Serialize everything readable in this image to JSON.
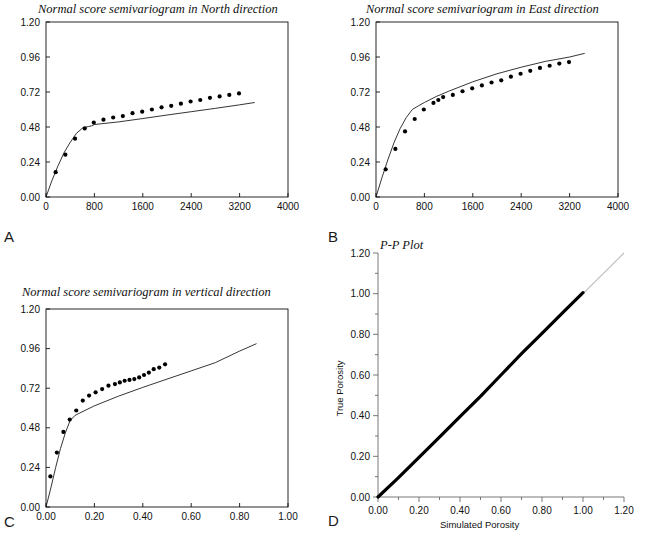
{
  "figure": {
    "width": 648,
    "height": 535,
    "background": "#ffffff",
    "line_color": "#111111",
    "marker_color": "#000000",
    "reference_line_color": "#bbbbbb"
  },
  "panels": [
    {
      "key": "A",
      "label": "A",
      "title": "Normal score semivariogram in North direction",
      "xlabel": "",
      "ylabel": "",
      "xticks": [
        "0",
        "800",
        "1600",
        "2400",
        "3200",
        "4000"
      ],
      "yticks": [
        "0.00",
        "0.24",
        "0.48",
        "0.72",
        "0.96",
        "1.20"
      ]
    },
    {
      "key": "B",
      "label": "B",
      "title": "Normal score semivariogram in East direction",
      "xlabel": "",
      "ylabel": "",
      "xticks": [
        "0",
        "800",
        "1600",
        "2400",
        "3200",
        "4000"
      ],
      "yticks": [
        "0.00",
        "0.24",
        "0.48",
        "0.72",
        "0.96",
        "1.20"
      ]
    },
    {
      "key": "C",
      "label": "C",
      "title": "Normal score semivariogram in vertical direction",
      "xlabel": "",
      "ylabel": "",
      "xticks": [
        "0.00",
        "0.20",
        "0.40",
        "0.60",
        "0.80",
        "1.00"
      ],
      "yticks": [
        "0.00",
        "0.24",
        "0.48",
        "0.72",
        "0.96",
        "1.20"
      ]
    },
    {
      "key": "D",
      "label": "D",
      "title": "P-P Plot",
      "xlabel": "Simulated Porosity",
      "ylabel": "True Porosity",
      "xticks": [
        "0.00",
        "0.20",
        "0.40",
        "0.60",
        "0.80",
        "1.00",
        "1.20"
      ],
      "yticks": [
        "0.00",
        "0.20",
        "0.40",
        "0.60",
        "0.80",
        "1.00",
        "1.20"
      ]
    }
  ],
  "chart_data": [
    {
      "type": "scatter",
      "panel": "A",
      "title": "Normal score semivariogram in North direction",
      "xlabel": "",
      "ylabel": "",
      "xlim": [
        0,
        4000
      ],
      "ylim": [
        0,
        1.2
      ],
      "grid": false,
      "legend": "none",
      "series": [
        {
          "name": "experimental semivariogram",
          "style": "points",
          "x": [
            160,
            320,
            480,
            640,
            790,
            950,
            1110,
            1270,
            1430,
            1590,
            1750,
            1910,
            2070,
            2230,
            2390,
            2550,
            2710,
            2870,
            3030,
            3190
          ],
          "y": [
            0.17,
            0.29,
            0.4,
            0.47,
            0.51,
            0.53,
            0.545,
            0.555,
            0.575,
            0.585,
            0.6,
            0.615,
            0.625,
            0.64,
            0.655,
            0.665,
            0.68,
            0.69,
            0.7,
            0.71
          ]
        },
        {
          "name": "model semivariogram",
          "style": "line",
          "x": [
            0,
            100,
            200,
            300,
            400,
            500,
            600,
            700,
            750,
            800,
            1200,
            1600,
            2000,
            2400,
            2800,
            3200,
            3450
          ],
          "y": [
            0.0,
            0.115,
            0.215,
            0.305,
            0.375,
            0.435,
            0.472,
            0.483,
            0.487,
            0.497,
            0.515,
            0.538,
            0.562,
            0.585,
            0.608,
            0.632,
            0.648
          ]
        }
      ]
    },
    {
      "type": "scatter",
      "panel": "B",
      "title": "Normal score semivariogram in East direction",
      "xlabel": "",
      "ylabel": "",
      "xlim": [
        0,
        4000
      ],
      "ylim": [
        0,
        1.2
      ],
      "grid": false,
      "legend": "none",
      "series": [
        {
          "name": "experimental semivariogram",
          "style": "points",
          "x": [
            160,
            320,
            480,
            640,
            790,
            950,
            1030,
            1110,
            1270,
            1430,
            1590,
            1750,
            1910,
            2070,
            2230,
            2390,
            2550,
            2710,
            2870,
            3030,
            3190
          ],
          "y": [
            0.19,
            0.33,
            0.45,
            0.535,
            0.6,
            0.645,
            0.665,
            0.685,
            0.7,
            0.725,
            0.745,
            0.765,
            0.785,
            0.8,
            0.825,
            0.845,
            0.865,
            0.885,
            0.9,
            0.915,
            0.925
          ]
        },
        {
          "name": "model semivariogram",
          "style": "line",
          "x": [
            0,
            100,
            200,
            300,
            400,
            500,
            600,
            700,
            800,
            1000,
            1200,
            1600,
            2000,
            2400,
            2800,
            3200,
            3450
          ],
          "y": [
            0.0,
            0.135,
            0.26,
            0.375,
            0.47,
            0.545,
            0.6,
            0.625,
            0.648,
            0.69,
            0.725,
            0.79,
            0.845,
            0.89,
            0.93,
            0.96,
            0.985
          ]
        }
      ]
    },
    {
      "type": "scatter",
      "panel": "C",
      "title": "Normal score semivariogram in vertical direction",
      "xlabel": "",
      "ylabel": "",
      "xlim": [
        0,
        1.0
      ],
      "ylim": [
        0,
        1.2
      ],
      "grid": false,
      "legend": "none",
      "series": [
        {
          "name": "experimental semivariogram",
          "style": "points",
          "x": [
            0.018,
            0.045,
            0.072,
            0.098,
            0.125,
            0.152,
            0.178,
            0.205,
            0.232,
            0.258,
            0.285,
            0.305,
            0.325,
            0.345,
            0.365,
            0.385,
            0.405,
            0.425,
            0.445,
            0.468,
            0.492
          ],
          "y": [
            0.185,
            0.33,
            0.455,
            0.53,
            0.585,
            0.645,
            0.675,
            0.695,
            0.715,
            0.735,
            0.745,
            0.755,
            0.765,
            0.77,
            0.775,
            0.785,
            0.8,
            0.815,
            0.835,
            0.845,
            0.865
          ]
        },
        {
          "name": "model semivariogram",
          "style": "line",
          "x": [
            0.0,
            0.02,
            0.04,
            0.06,
            0.08,
            0.1,
            0.12,
            0.14,
            0.2,
            0.3,
            0.4,
            0.5,
            0.6,
            0.7,
            0.8,
            0.87
          ],
          "y": [
            0.0,
            0.115,
            0.24,
            0.355,
            0.45,
            0.525,
            0.555,
            0.57,
            0.613,
            0.672,
            0.725,
            0.775,
            0.825,
            0.875,
            0.945,
            0.99
          ]
        }
      ]
    },
    {
      "type": "line",
      "panel": "D",
      "title": "P-P Plot",
      "xlabel": "Simulated Porosity",
      "ylabel": "True Porosity",
      "xlim": [
        0,
        1.2
      ],
      "ylim": [
        0,
        1.2
      ],
      "grid": false,
      "legend": "none",
      "series": [
        {
          "name": "reference 1:1 line",
          "style": "thin-line",
          "x": [
            0.0,
            1.2
          ],
          "y": [
            0.0,
            1.2
          ]
        },
        {
          "name": "P-P band",
          "style": "thick-line",
          "x": [
            0.0,
            0.1,
            0.2,
            0.3,
            0.4,
            0.5,
            0.6,
            0.7,
            0.8,
            0.9,
            1.0
          ],
          "y": [
            0.0,
            0.095,
            0.195,
            0.295,
            0.395,
            0.495,
            0.6,
            0.705,
            0.805,
            0.905,
            1.005
          ]
        }
      ]
    }
  ]
}
